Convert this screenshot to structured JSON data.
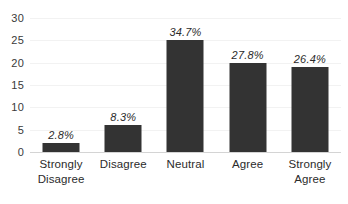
{
  "chart_data": {
    "type": "bar",
    "title": "",
    "subtitle": "",
    "xlabel": "",
    "ylabel": "",
    "ylim": [
      0,
      30
    ],
    "ytick_step": 5,
    "yticks": [
      "0",
      "5",
      "10",
      "15",
      "20",
      "25",
      "30"
    ],
    "grid": true,
    "legend": false,
    "legend_position": "none",
    "categories": [
      "Strongly Disagree",
      "Disagree",
      "Neutral",
      "Agree",
      "Strongly Agree"
    ],
    "category_lines": [
      [
        "Strongly",
        "Disagree"
      ],
      [
        "Disagree"
      ],
      [
        "Neutral"
      ],
      [
        "Agree"
      ],
      [
        "Strongly",
        "Agree"
      ]
    ],
    "values": [
      2,
      6,
      25,
      20,
      19
    ],
    "data_labels": [
      "2.8%",
      "8.3%",
      "34.7%",
      "27.8%",
      "26.4%"
    ],
    "bar_color": "#333333",
    "gridline_color": "#f2f2f2",
    "axis_color": "#d4d4d4",
    "text_color": "#2b2b2b"
  }
}
